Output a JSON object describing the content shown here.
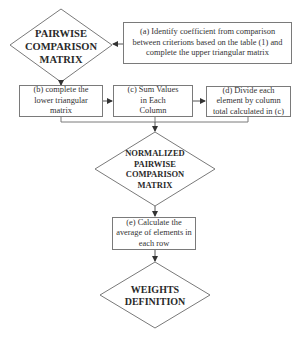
{
  "diagram": {
    "nodes": {
      "pairwise_matrix": {
        "label": "PAIRWISE\nCOMPARISON\nMATRIX",
        "shape": "diamond"
      },
      "step_a": {
        "label": "(a) Identify coefficient from comparison between criterions based on the table (1) and complete the upper triangular matrix",
        "shape": "rectangle"
      },
      "step_b": {
        "label": "(b) complete the lower triangular matrix",
        "shape": "rectangle"
      },
      "step_c": {
        "label": "(c) Sum Values in Each Column",
        "shape": "rectangle"
      },
      "step_d": {
        "label": "(d)  Divide each element by column total calculated in (c)",
        "shape": "rectangle"
      },
      "normalized_matrix": {
        "label": "NORMALIZED\nPAIRWISE\nCOMPARISON\nMATRIX",
        "shape": "diamond"
      },
      "step_e": {
        "label": "(e) Calculate the average of elements in each row",
        "shape": "rectangle"
      },
      "weights": {
        "label": "WEIGHTS\nDEFINITION",
        "shape": "diamond"
      }
    },
    "edges": [
      {
        "from": "step_a",
        "to": "pairwise_matrix"
      },
      {
        "from": "pairwise_matrix",
        "to": "step_b"
      },
      {
        "from": "step_b",
        "to": "step_c"
      },
      {
        "from": "step_c",
        "to": "step_d"
      },
      {
        "from": "step_b",
        "to": "normalized_matrix"
      },
      {
        "from": "step_c",
        "to": "normalized_matrix"
      },
      {
        "from": "step_d",
        "to": "normalized_matrix"
      },
      {
        "from": "normalized_matrix",
        "to": "step_e"
      },
      {
        "from": "step_e",
        "to": "weights"
      }
    ],
    "colors": {
      "stroke": "#7a7a7a",
      "text": "#2a2a2a",
      "background": "#ffffff"
    }
  }
}
